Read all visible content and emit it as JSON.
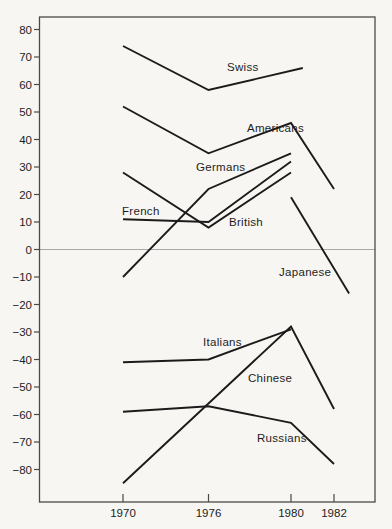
{
  "chart_data": {
    "type": "line",
    "title": "",
    "xlabel": "",
    "ylabel": "",
    "x_tick_labels": [
      "1970",
      "1976",
      "1980",
      "1982"
    ],
    "x_tick_years": [
      1970,
      1976,
      1980,
      1982
    ],
    "y_tick_labels": [
      "80",
      "70",
      "60",
      "50",
      "40",
      "30",
      "20",
      "10",
      "0",
      "−10",
      "−20",
      "−30",
      "−40",
      "−50",
      "−60",
      "−70",
      "−80"
    ],
    "y_tick_values": [
      80,
      70,
      60,
      50,
      40,
      30,
      20,
      10,
      0,
      -10,
      -20,
      -30,
      -40,
      -50,
      -60,
      -70,
      -80
    ],
    "ylim": [
      -92,
      84
    ],
    "grid": "zero-line-only",
    "legend_position": "inline-labels",
    "series": [
      {
        "name": "Swiss",
        "points": [
          [
            1970,
            74
          ],
          [
            1976,
            58
          ],
          [
            1980.55,
            66
          ]
        ],
        "label_px": [
          227,
          71
        ]
      },
      {
        "name": "Americans",
        "points": [
          [
            1970,
            52
          ],
          [
            1976,
            35
          ],
          [
            1980,
            46
          ],
          [
            1982,
            22
          ]
        ],
        "label_px": [
          247,
          132
        ]
      },
      {
        "name": "Germans",
        "points": [
          [
            1970,
            -10
          ],
          [
            1976,
            22
          ],
          [
            1980,
            35
          ]
        ],
        "label_px": [
          196,
          171
        ]
      },
      {
        "name": "French",
        "points": [
          [
            1970,
            11
          ],
          [
            1976,
            10
          ],
          [
            1980,
            32
          ]
        ],
        "label_px": [
          122,
          215
        ]
      },
      {
        "name": "British",
        "points": [
          [
            1970,
            28
          ],
          [
            1976,
            8
          ],
          [
            1980,
            28
          ]
        ],
        "label_px": [
          229,
          226
        ]
      },
      {
        "name": "Japanese",
        "points": [
          [
            1980,
            19
          ],
          [
            1982.7,
            -16
          ]
        ],
        "label_px": [
          279,
          276
        ]
      },
      {
        "name": "Italians",
        "points": [
          [
            1970,
            -41
          ],
          [
            1976,
            -40
          ],
          [
            1980,
            -29
          ]
        ],
        "label_px": [
          203,
          346
        ]
      },
      {
        "name": "Chinese",
        "points": [
          [
            1970,
            -85
          ],
          [
            1980,
            -28
          ],
          [
            1982,
            -58
          ]
        ],
        "label_px": [
          248,
          382
        ]
      },
      {
        "name": "Russians",
        "points": [
          [
            1970,
            -59
          ],
          [
            1976,
            -57
          ],
          [
            1980,
            -63
          ],
          [
            1982,
            -78
          ]
        ],
        "label_px": [
          257,
          442
        ]
      }
    ],
    "colors": {
      "background": "#f7f6f3",
      "line_ink": "#1b1b1b",
      "frame": "#4a4a4a",
      "zero_line": "#a8a8a8",
      "text": "#1d1d1d"
    }
  }
}
